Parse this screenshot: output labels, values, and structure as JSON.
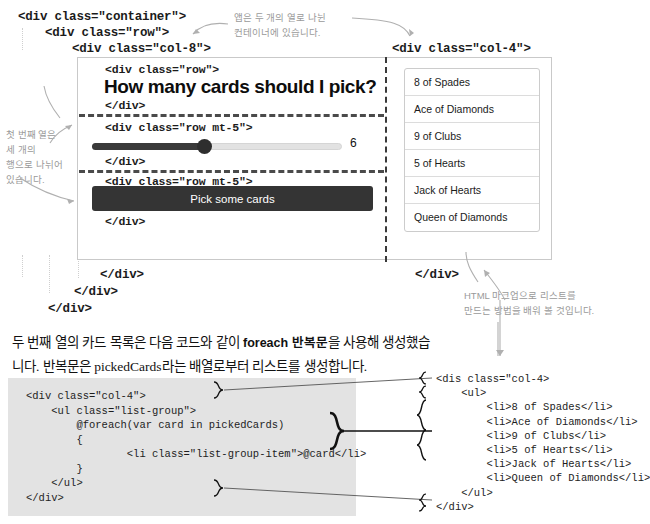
{
  "markup": {
    "container_open": "<div class=\"container\">",
    "row_open": "<div class=\"row\">",
    "col8_open": "<div class=\"col-8\">",
    "col4_open": "<div class=\"col-4\">",
    "row_inner_open": "<div class=\"row\">",
    "row_mt5_open": "<div class=\"row mt-5\">",
    "div_close": "</div>",
    "col8_close": "</div>",
    "col4_close": "</div>",
    "row_close": "</div>",
    "container_close": "</div>"
  },
  "app": {
    "headline": "How many cards should I pick?",
    "slider": {
      "value": "6",
      "min": 0,
      "max": 12,
      "fill_percent": 45
    },
    "button_label": "Pick some cards",
    "cards": [
      "8 of Spades",
      "Ace of Diamonds",
      "9 of Clubs",
      "5 of Hearts",
      "Jack of Hearts",
      "Queen of Diamonds"
    ]
  },
  "annotations": {
    "top_right": "앱은 두 개의 열로 나뉜\n컨테이너에 있습니다.",
    "left": "첫 번째 열은\n세 개의\n행으로 나뉘어\n있습니다.",
    "bottom_right": "HTML 마크업으로 리스트를\n만드는 방법을 배워 볼 것입니다."
  },
  "paragraph": {
    "line1_a": "두 번째 열의 카드 목록은 다음 코드와 같이 ",
    "line1_b": "foreach 반복문",
    "line1_c": "을 사용해 생성했습",
    "line2": "니다. 반복문은 pickedCards라는 배열로부터 리스트를 생성합니다."
  },
  "code_block": {
    "lines": [
      "<div class=\"col-4\">",
      "    <ul class=\"list-group\">",
      "        @foreach(var card in pickedCards)",
      "        {",
      "                <li class=\"list-group-item\">@card</li>",
      "        }",
      "    </ul>",
      "</div>"
    ]
  },
  "expanded_code": {
    "lines": [
      "<dis class=\"col-4>",
      "    <ul>",
      "        <li>8 of Spades</li>",
      "        <li>Ace of Diamonds</li>",
      "        <li>9 of Clubs</li>",
      "        <li>5 of Hearts</li>",
      "        <li>Jack of Hearts</li>",
      "        <li>Queen of Diamonds</li>",
      "    </ul>",
      "</div>"
    ]
  },
  "colors": {
    "button": "#343434",
    "slider_fill": "#3a3a3a",
    "code_bg": "#e3e3e3",
    "note": "#9a9a9a"
  }
}
